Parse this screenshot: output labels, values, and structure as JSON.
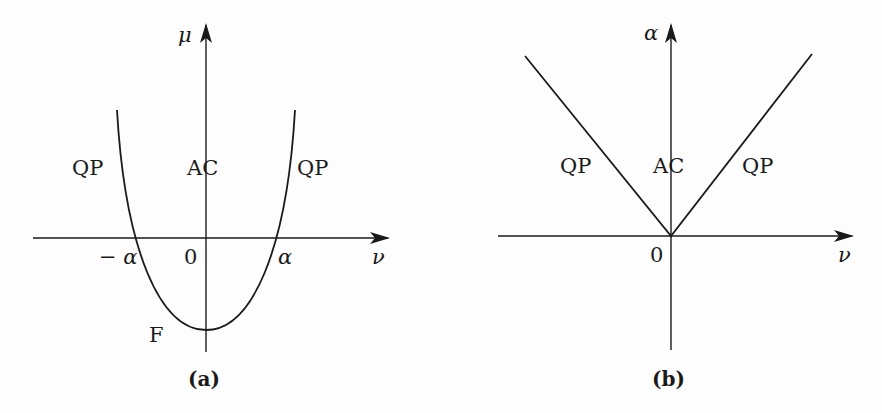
{
  "panels": [
    {
      "id": "a",
      "caption": "(a)",
      "y_axis_label": "μ",
      "x_axis_label": "ν",
      "curve": "parabola",
      "region_labels": {
        "left": "QP",
        "center": "AC",
        "right": "QP",
        "bottom": "F"
      },
      "tick_labels": {
        "neg": "− α",
        "origin": "0",
        "pos": "α"
      }
    },
    {
      "id": "b",
      "caption": "(b)",
      "y_axis_label": "α",
      "x_axis_label": "ν",
      "curve": "V-shape",
      "region_labels": {
        "left": "QP",
        "center": "AC",
        "right": "QP"
      },
      "tick_labels": {
        "origin": "0"
      }
    }
  ],
  "colors": {
    "ink": "#1a1a1a",
    "background": "#fdfdfd"
  }
}
